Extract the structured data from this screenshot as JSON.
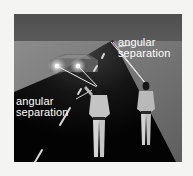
{
  "figure": {
    "labels": {
      "far_observer": {
        "line1": "angular",
        "line2": "separation"
      },
      "near_observer": {
        "line1": "angular",
        "line2": "separation"
      }
    },
    "colors": {
      "page_background": "#f4f4f2",
      "sky": "#555555",
      "horizon": "#8a8a8a",
      "road": "#050505",
      "roadside": "#6a6a6a",
      "headlight": "#ffffff",
      "sight_lines": "#e8e8e8",
      "label_text": "#ffffff"
    }
  }
}
